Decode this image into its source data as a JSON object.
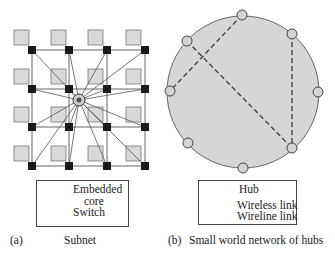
{
  "colors": {
    "core_fill": "#d9d9d9",
    "core_stroke": "#777777",
    "switch_fill": "#1a1a1a",
    "hub_fill": "#d4d4d4",
    "circle_fill": "#d6d6d6",
    "line": "#555555"
  },
  "panel_a": {
    "label": "(a)",
    "title": "Subnet",
    "legend": {
      "core_label_line1": "Embedded",
      "core_label_line2": "core",
      "switch_label": "Switch"
    },
    "grid": {
      "rows": 4,
      "cols": 4,
      "switch_x": [
        32,
        69,
        107,
        145
      ],
      "switch_y": [
        50,
        89,
        127,
        166
      ],
      "center_hub": [
        79,
        100
      ]
    }
  },
  "panel_b": {
    "label": "(b)",
    "title": "Small world network of hubs",
    "legend": {
      "hub_label": "Hub",
      "wireless_label": "Wireless link",
      "wireline_label": "Wireline link"
    },
    "ring": {
      "cx": 243,
      "cy": 92,
      "r": 76
    },
    "hubs": [
      [
        242,
        15
      ],
      [
        292,
        34
      ],
      [
        187,
        41
      ],
      [
        170,
        91
      ],
      [
        318,
        92
      ],
      [
        188,
        143
      ],
      [
        292,
        148
      ],
      [
        243,
        168
      ]
    ],
    "wireless_links": [
      [
        [
          242,
          15
        ],
        [
          170,
          91
        ]
      ],
      [
        [
          187,
          41
        ],
        [
          292,
          148
        ]
      ],
      [
        [
          292,
          34
        ],
        [
          292,
          148
        ]
      ]
    ]
  }
}
